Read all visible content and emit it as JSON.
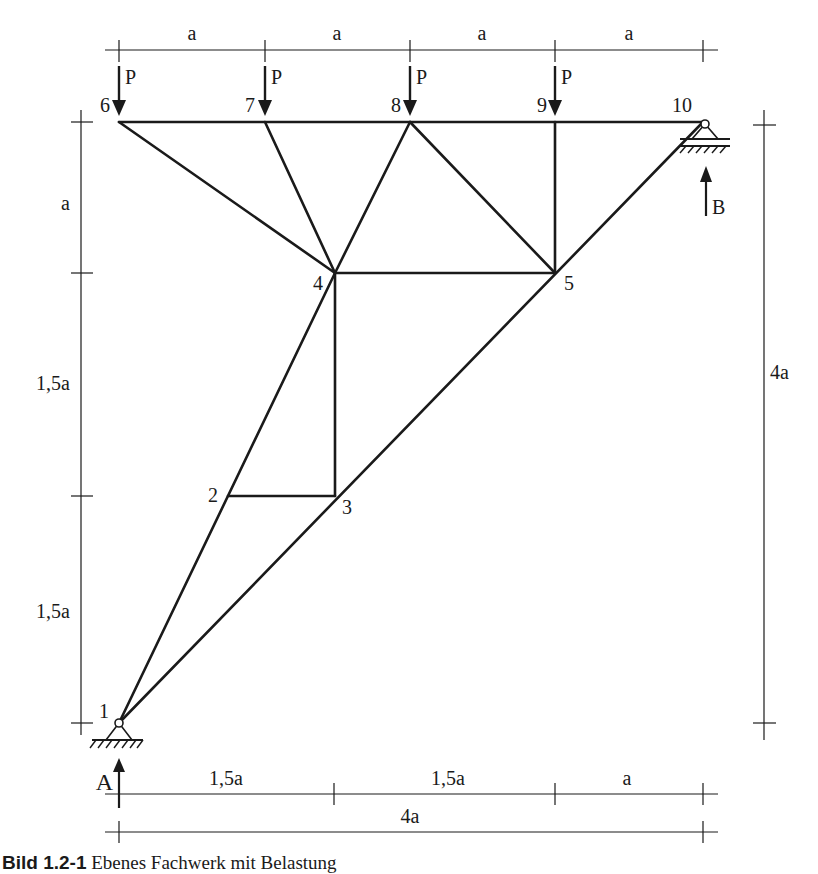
{
  "figure": {
    "caption_prefix": "Bild 1.2-1",
    "caption_text": "Ebenes Fachwerk mit Belastung",
    "nodes": [
      {
        "id": "1",
        "label": "1"
      },
      {
        "id": "2",
        "label": "2"
      },
      {
        "id": "3",
        "label": "3"
      },
      {
        "id": "4",
        "label": "4"
      },
      {
        "id": "5",
        "label": "5"
      },
      {
        "id": "6",
        "label": "6"
      },
      {
        "id": "7",
        "label": "7"
      },
      {
        "id": "8",
        "label": "8"
      },
      {
        "id": "9",
        "label": "9"
      },
      {
        "id": "10",
        "label": "10"
      }
    ],
    "members": [
      [
        "1",
        "2"
      ],
      [
        "2",
        "4"
      ],
      [
        "1",
        "3"
      ],
      [
        "3",
        "5"
      ],
      [
        "5",
        "10"
      ],
      [
        "2",
        "3"
      ],
      [
        "3",
        "4"
      ],
      [
        "4",
        "5"
      ],
      [
        "4",
        "6"
      ],
      [
        "4",
        "7"
      ],
      [
        "4",
        "8"
      ],
      [
        "8",
        "5"
      ],
      [
        "9",
        "5"
      ],
      [
        "6",
        "7"
      ],
      [
        "7",
        "8"
      ],
      [
        "8",
        "9"
      ],
      [
        "9",
        "10"
      ]
    ],
    "loads": {
      "label": "P",
      "nodes": [
        "6",
        "7",
        "8",
        "9"
      ]
    },
    "supports": {
      "A": {
        "label": "A",
        "node": "1",
        "type": "fixed pin"
      },
      "B": {
        "label": "B",
        "node": "10",
        "type": "roller"
      }
    },
    "dimensions": {
      "top": [
        "a",
        "a",
        "a",
        "a"
      ],
      "left": [
        "a",
        "1,5a",
        "1,5a"
      ],
      "right": "4a",
      "bottom_segments": [
        "1,5a",
        "1,5a",
        "a"
      ],
      "bottom_total": "4a"
    }
  }
}
